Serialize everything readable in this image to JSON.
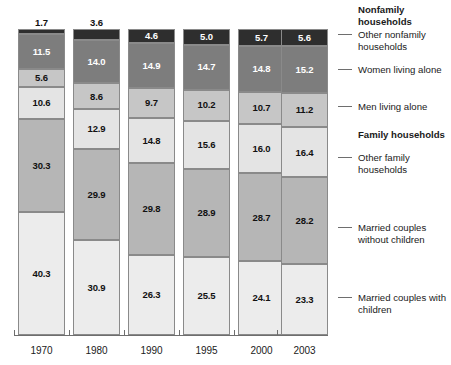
{
  "chart_data": {
    "type": "bar",
    "stacked": true,
    "title": "",
    "subtitle": "",
    "xlabel": "",
    "ylabel": "",
    "ylim": [
      0,
      100
    ],
    "grid": false,
    "legend_position": "right",
    "units": "percent",
    "categories": [
      "1970",
      "1980",
      "1990",
      "1995",
      "2000",
      "2003"
    ],
    "series": [
      {
        "name": "Married couples with children",
        "group": "Family households",
        "color": "#ececec",
        "values": [
          40.3,
          30.9,
          26.3,
          25.5,
          24.1,
          23.3
        ]
      },
      {
        "name": "Married couples without children",
        "group": "Family households",
        "color": "#b6b6b6",
        "values": [
          30.3,
          29.9,
          29.8,
          28.9,
          28.7,
          28.2
        ]
      },
      {
        "name": "Other family households",
        "group": "Family households",
        "color": "#e4e4e4",
        "values": [
          10.6,
          12.9,
          14.8,
          15.6,
          16.0,
          16.4
        ]
      },
      {
        "name": "Men living alone",
        "group": "Nonfamily households",
        "color": "#c6c6c6",
        "values": [
          5.6,
          8.6,
          9.7,
          10.2,
          10.7,
          11.2
        ]
      },
      {
        "name": "Women living alone",
        "group": "Nonfamily households",
        "color": "#7d7d7d",
        "values": [
          11.5,
          14.0,
          14.9,
          14.7,
          14.8,
          15.2
        ]
      },
      {
        "name": "Other nonfamily households",
        "group": "Nonfamily households",
        "color": "#2e2e2e",
        "values": [
          1.7,
          3.6,
          4.6,
          5.0,
          5.7,
          5.6
        ]
      }
    ]
  },
  "legend": {
    "groups": [
      {
        "label": "Nonfamily households"
      },
      {
        "label": "Family households"
      }
    ],
    "entries": [
      {
        "label": "Other nonfamily households"
      },
      {
        "label": "Women living alone"
      },
      {
        "label": "Men living alone"
      },
      {
        "label": "Other family households"
      },
      {
        "label": "Married couples without children"
      },
      {
        "label": "Married couples with children"
      }
    ]
  },
  "axis": {
    "years": [
      "1970",
      "1980",
      "1990",
      "1995",
      "2000",
      "2003"
    ]
  }
}
